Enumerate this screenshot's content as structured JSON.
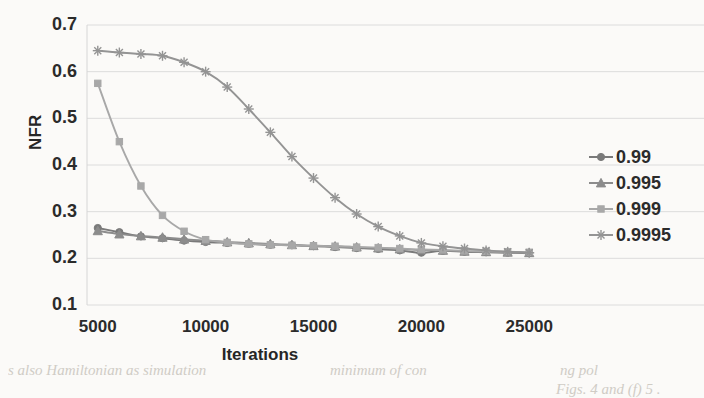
{
  "chart_data": {
    "type": "line",
    "title": "",
    "subtitle": "",
    "xlabel": "Iterations",
    "ylabel": "NFR",
    "x": [
      5000,
      6000,
      7000,
      8000,
      9000,
      10000,
      11000,
      12000,
      13000,
      14000,
      15000,
      16000,
      17000,
      18000,
      19000,
      20000,
      21000,
      22000,
      23000,
      24000,
      25000
    ],
    "xlim": [
      4500,
      25500
    ],
    "ylim": [
      0.1,
      0.7
    ],
    "xticks": [
      5000,
      10000,
      15000,
      20000,
      25000
    ],
    "xticklabels": [
      "5000",
      "10000",
      "15000",
      "20000",
      "25000"
    ],
    "yticks": [
      0.1,
      0.2,
      0.3,
      0.4,
      0.5,
      0.6,
      0.7
    ],
    "yticklabels": [
      "0.1",
      "0.2",
      "0.3",
      "0.4",
      "0.5",
      "0.6",
      "0.7"
    ],
    "grid": "horizontal",
    "legend_position": "right",
    "series": [
      {
        "name": "0.99",
        "marker": "circle",
        "color": "#7a7a7a",
        "values": [
          0.265,
          0.256,
          0.247,
          0.243,
          0.238,
          0.235,
          0.233,
          0.231,
          0.229,
          0.228,
          0.226,
          0.224,
          0.222,
          0.22,
          0.217,
          0.212,
          0.216,
          0.214,
          0.213,
          0.212,
          0.211
        ]
      },
      {
        "name": "0.995",
        "marker": "triangle",
        "color": "#8c8c8c",
        "values": [
          0.259,
          0.252,
          0.248,
          0.245,
          0.241,
          0.238,
          0.235,
          0.233,
          0.231,
          0.229,
          0.227,
          0.226,
          0.224,
          0.222,
          0.22,
          0.218,
          0.217,
          0.215,
          0.214,
          0.213,
          0.212
        ]
      },
      {
        "name": "0.999",
        "marker": "square",
        "color": "#a8a8a8",
        "values": [
          0.575,
          0.45,
          0.355,
          0.292,
          0.258,
          0.24,
          0.234,
          0.231,
          0.229,
          0.228,
          0.227,
          0.226,
          0.224,
          0.223,
          0.221,
          0.219,
          0.218,
          0.216,
          0.215,
          0.214,
          0.213
        ]
      },
      {
        "name": "0.9995",
        "marker": "asterisk",
        "color": "#949494",
        "values": [
          0.645,
          0.641,
          0.638,
          0.634,
          0.62,
          0.6,
          0.567,
          0.52,
          0.47,
          0.418,
          0.372,
          0.33,
          0.295,
          0.268,
          0.248,
          0.233,
          0.226,
          0.221,
          0.217,
          0.214,
          0.212
        ]
      }
    ]
  },
  "legend": {
    "items": [
      {
        "label": "0.99",
        "marker": "circle"
      },
      {
        "label": "0.995",
        "marker": "triangle"
      },
      {
        "label": "0.999",
        "marker": "square"
      },
      {
        "label": "0.9995",
        "marker": "asterisk"
      }
    ]
  },
  "background_text": {
    "line_top": "s also Hamiltonian as simulation",
    "line_top2": "minimum of con",
    "line_top3": "ng pol",
    "line_bottom": "Figs. 4 and (f) 5 ."
  }
}
